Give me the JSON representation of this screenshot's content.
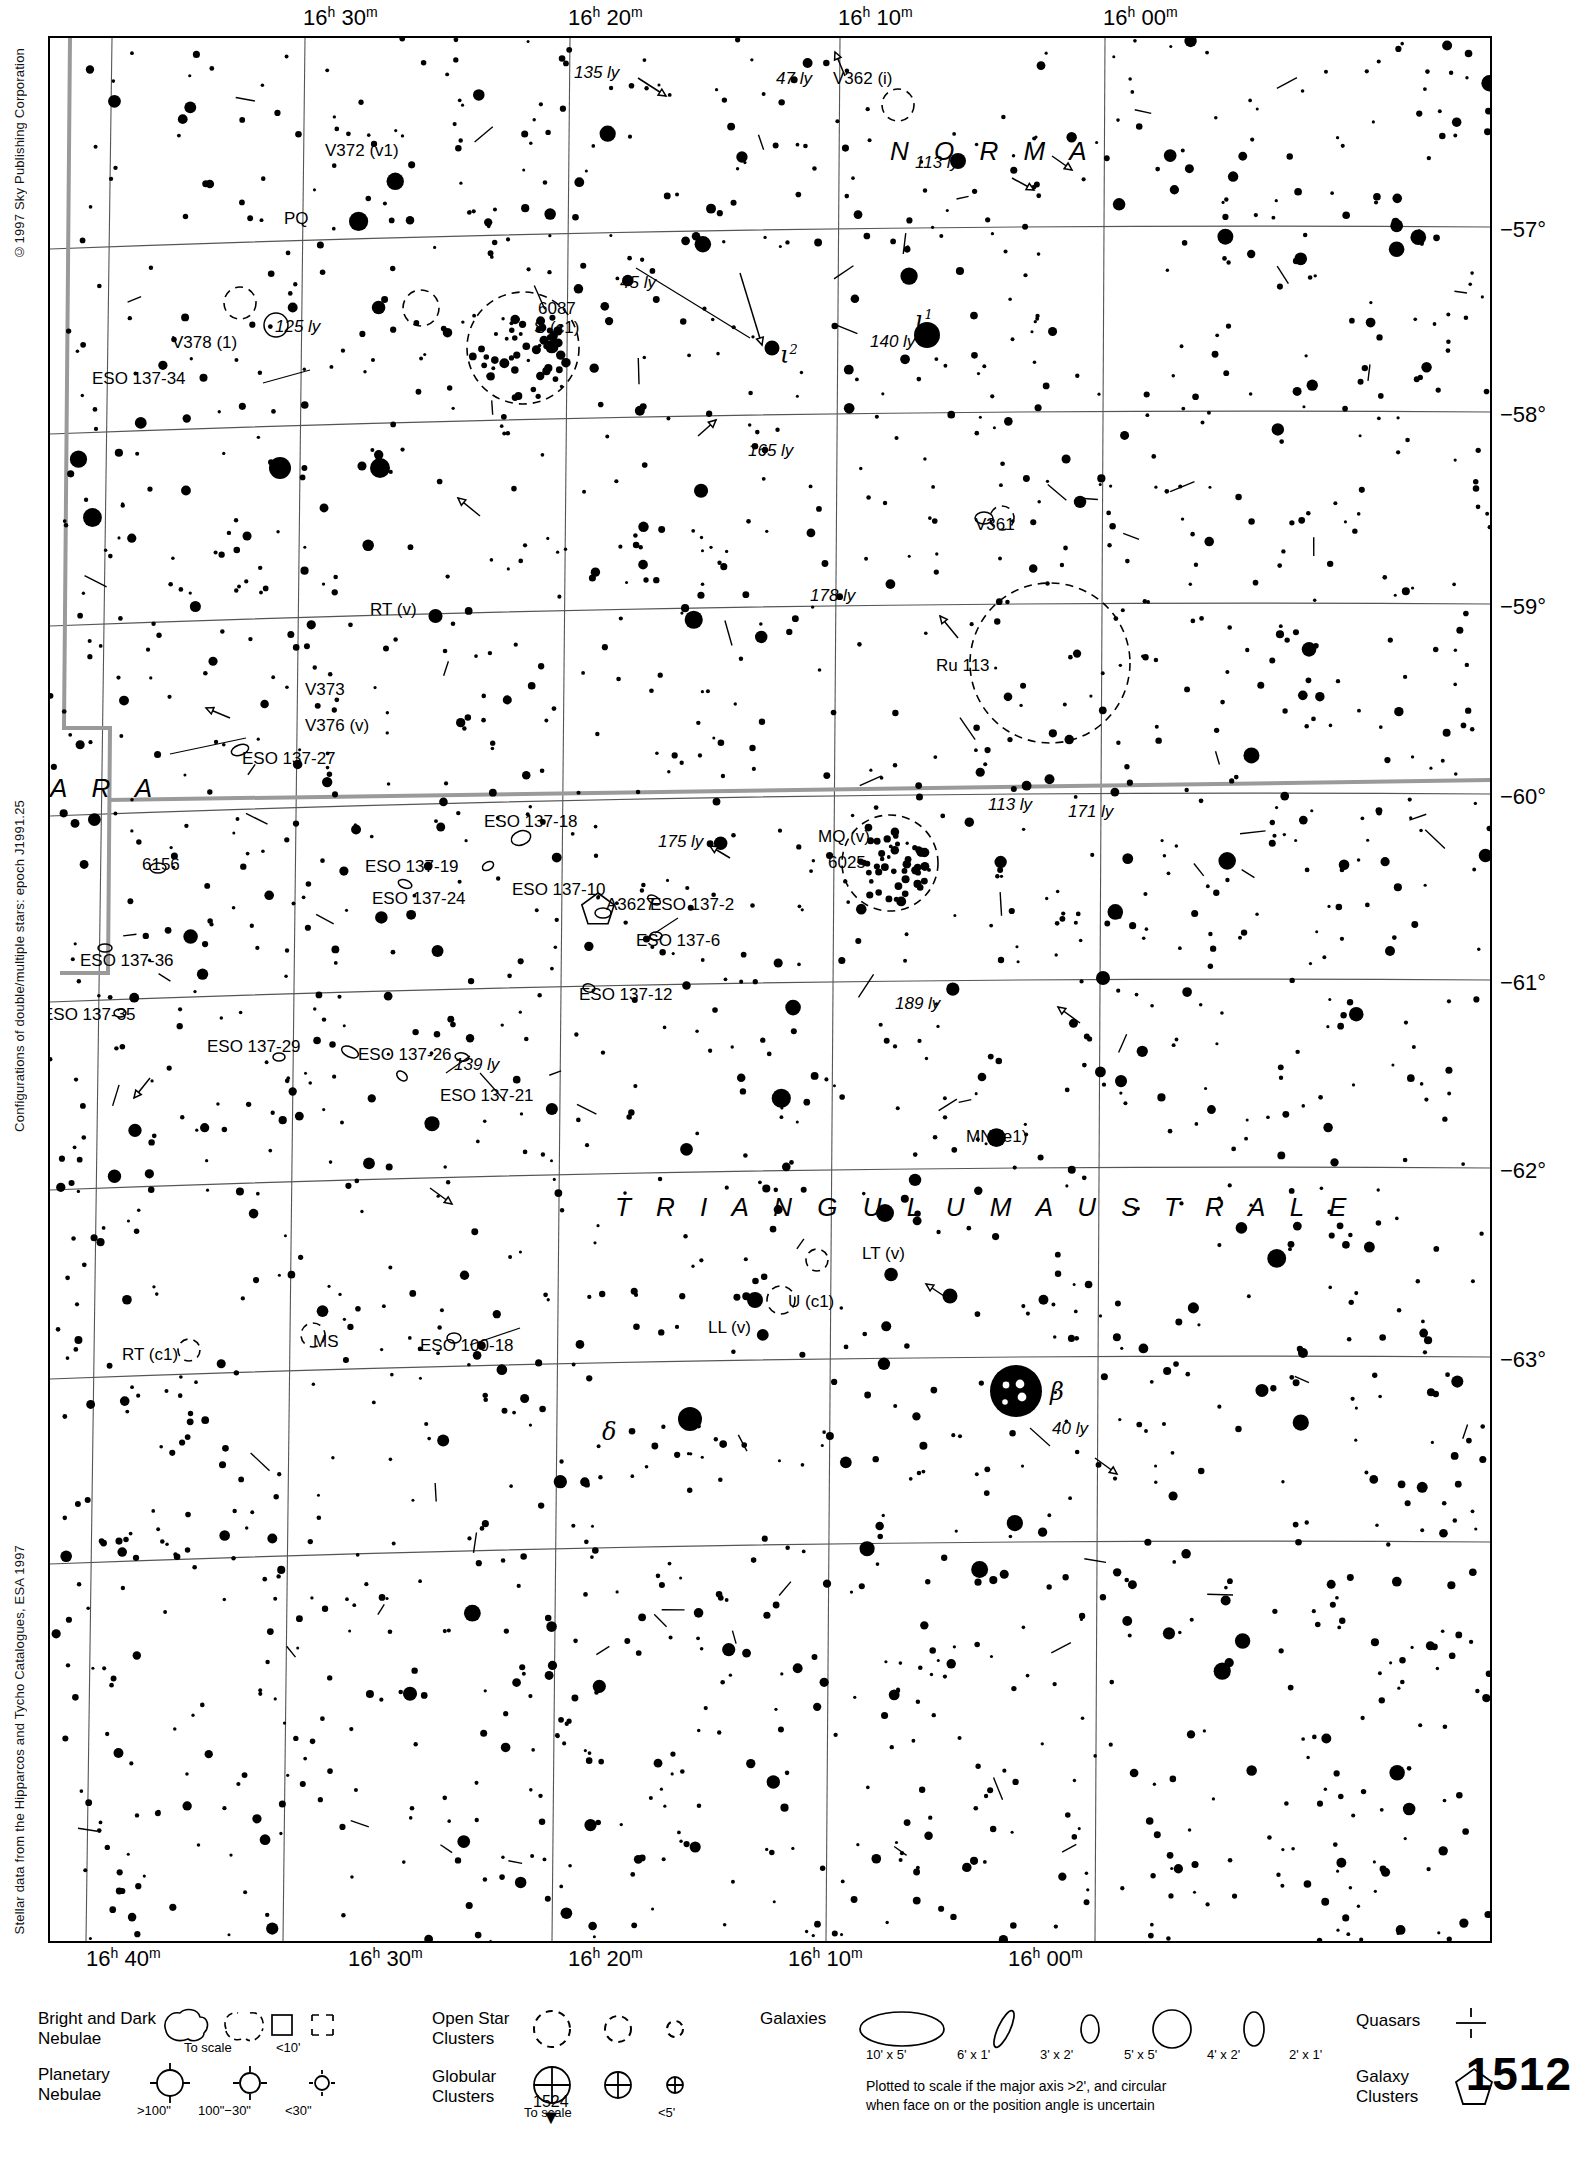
{
  "meta": {
    "chart_number": "1512",
    "copyright": "©1997 Sky Publishing Corporation",
    "config_note": "Configurations of double/multiple stars: epoch J1991.25",
    "data_note": "Stellar data from the Hipparcos and Tycho Catalogues, ESA 1997",
    "next_chart_label": "1524",
    "next_chart_arrow": "▼"
  },
  "axes": {
    "ra_top": [
      {
        "label": "16h 30m",
        "h": "16",
        "m": "30",
        "x": 255
      },
      {
        "label": "16h 20m",
        "h": "16",
        "m": "20",
        "x": 520
      },
      {
        "label": "16h 10m",
        "h": "16",
        "m": "10",
        "x": 790
      },
      {
        "label": "16h 00m",
        "h": "16",
        "m": "00",
        "x": 1055
      }
    ],
    "ra_bottom": [
      {
        "label": "16h 40m",
        "h": "16",
        "m": "40",
        "x": 38
      },
      {
        "label": "16h 30m",
        "h": "16",
        "m": "30",
        "x": 300
      },
      {
        "label": "16h 20m",
        "h": "16",
        "m": "20",
        "x": 520
      },
      {
        "label": "16h 10m",
        "h": "16",
        "m": "10",
        "x": 740
      },
      {
        "label": "16h 00m",
        "h": "16",
        "m": "00",
        "x": 960
      }
    ],
    "dec_right": [
      {
        "label": "−57°",
        "y": 195
      },
      {
        "label": "−58°",
        "y": 380
      },
      {
        "label": "−59°",
        "y": 572
      },
      {
        "label": "−60°",
        "y": 762
      },
      {
        "label": "−61°",
        "y": 948
      },
      {
        "label": "−62°",
        "y": 1136
      },
      {
        "label": "−63°",
        "y": 1325
      }
    ]
  },
  "constellations": [
    {
      "name": "N O R M A",
      "x": 840,
      "y": 98
    },
    {
      "name": "A R A",
      "x": 0,
      "y": 735
    },
    {
      "name": "T R I A N G U L U M   A U S T R A L E",
      "x": 565,
      "y": 1154
    }
  ],
  "labels": [
    {
      "text": "135 ly",
      "x": 524,
      "y": 26,
      "italic": true
    },
    {
      "text": "47 ly",
      "x": 726,
      "y": 32,
      "italic": true
    },
    {
      "text": "V362 (i)",
      "x": 783,
      "y": 32,
      "italic": false
    },
    {
      "text": "V372 (v1)",
      "x": 275,
      "y": 104,
      "italic": false
    },
    {
      "text": "113 ly",
      "x": 865,
      "y": 116,
      "italic": true
    },
    {
      "text": "PQ",
      "x": 234,
      "y": 172,
      "italic": false
    },
    {
      "text": "45 ly",
      "x": 570,
      "y": 236,
      "italic": true
    },
    {
      "text": "6087",
      "x": 488,
      "y": 262,
      "italic": false
    },
    {
      "text": "S (c1)",
      "x": 484,
      "y": 281,
      "italic": false
    },
    {
      "text": "125 ly",
      "x": 225,
      "y": 280,
      "italic": true
    },
    {
      "text": "V378 (1)",
      "x": 122,
      "y": 296,
      "italic": false
    },
    {
      "text": "140 ly",
      "x": 820,
      "y": 295,
      "italic": true
    },
    {
      "text": "ESO 137-34",
      "x": 42,
      "y": 332,
      "italic": false
    },
    {
      "text": "165 ly",
      "x": 698,
      "y": 404,
      "italic": true
    },
    {
      "text": "V361",
      "x": 925,
      "y": 478,
      "italic": false
    },
    {
      "text": "178 ly",
      "x": 760,
      "y": 549,
      "italic": true
    },
    {
      "text": "RT (v)",
      "x": 320,
      "y": 563,
      "italic": false
    },
    {
      "text": "Ru 113",
      "x": 886,
      "y": 619,
      "italic": false
    },
    {
      "text": "V373",
      "x": 255,
      "y": 643,
      "italic": false
    },
    {
      "text": "V376 (v)",
      "x": 255,
      "y": 679,
      "italic": false
    },
    {
      "text": "ESO 137-27",
      "x": 192,
      "y": 712,
      "italic": false
    },
    {
      "text": "ESO 137-18",
      "x": 434,
      "y": 775,
      "italic": false
    },
    {
      "text": "113 ly",
      "x": 938,
      "y": 758,
      "italic": true
    },
    {
      "text": "171 ly",
      "x": 1018,
      "y": 765,
      "italic": true
    },
    {
      "text": "175 ly",
      "x": 608,
      "y": 795,
      "italic": true
    },
    {
      "text": "MQ (v)",
      "x": 768,
      "y": 790,
      "italic": false
    },
    {
      "text": "6025",
      "x": 778,
      "y": 816,
      "italic": false
    },
    {
      "text": "6156",
      "x": 92,
      "y": 818,
      "italic": false
    },
    {
      "text": "ESO 137-19",
      "x": 315,
      "y": 820,
      "italic": false
    },
    {
      "text": "ESO 137-10",
      "x": 462,
      "y": 843,
      "italic": false
    },
    {
      "text": "ESO 137-24",
      "x": 322,
      "y": 852,
      "italic": false
    },
    {
      "text": "A3627",
      "x": 556,
      "y": 858,
      "italic": false
    },
    {
      "text": "ESO 137-2",
      "x": 600,
      "y": 858,
      "italic": false
    },
    {
      "text": "ESO 137-6",
      "x": 586,
      "y": 894,
      "italic": false
    },
    {
      "text": "ESO 137-36",
      "x": 30,
      "y": 914,
      "italic": false
    },
    {
      "text": "ESO 137-12",
      "x": 529,
      "y": 948,
      "italic": false
    },
    {
      "text": "189 ly",
      "x": 845,
      "y": 957,
      "italic": true
    },
    {
      "text": "ESO 137-35",
      "x": -8,
      "y": 968,
      "italic": false
    },
    {
      "text": "ESO 137-29",
      "x": 157,
      "y": 1000,
      "italic": false
    },
    {
      "text": "ESO 137-26",
      "x": 308,
      "y": 1008,
      "italic": false
    },
    {
      "text": "139 ly",
      "x": 404,
      "y": 1018,
      "italic": true
    },
    {
      "text": "ESO 137-21",
      "x": 390,
      "y": 1049,
      "italic": false
    },
    {
      "text": "MN (e1)",
      "x": 916,
      "y": 1090,
      "italic": false
    },
    {
      "text": "LT (v)",
      "x": 812,
      "y": 1207,
      "italic": false
    },
    {
      "text": "U (c1)",
      "x": 738,
      "y": 1255,
      "italic": false
    },
    {
      "text": "LL (v)",
      "x": 658,
      "y": 1281,
      "italic": false
    },
    {
      "text": "RT (c1)",
      "x": 72,
      "y": 1308,
      "italic": false
    },
    {
      "text": "MS",
      "x": 263,
      "y": 1295,
      "italic": false
    },
    {
      "text": "ESO 100-18",
      "x": 370,
      "y": 1299,
      "italic": false
    },
    {
      "text": "40 ly",
      "x": 1002,
      "y": 1382,
      "italic": true
    }
  ],
  "greek_labels": [
    {
      "glyph": "ι",
      "sup": "1",
      "x": 865,
      "y": 268
    },
    {
      "glyph": "ι",
      "sup": "2",
      "x": 730,
      "y": 303
    },
    {
      "glyph": "δ",
      "sup": "",
      "x": 552,
      "y": 1380
    },
    {
      "glyph": "β",
      "sup": "",
      "x": 1000,
      "y": 1340
    }
  ],
  "legend": {
    "bright_dark_nebulae": {
      "title": "Bright and Dark\nNebulae",
      "captions": [
        "To scale",
        "<10'"
      ]
    },
    "planetary_nebulae": {
      "title": "Planetary\nNebulae",
      "captions": [
        ">100\"",
        "100\"−30\"",
        "<30\""
      ]
    },
    "open_star_clusters": {
      "title": "Open Star\nClusters",
      "captions": []
    },
    "globular_clusters": {
      "title": "Globular\nClusters",
      "captions": [
        "To scale",
        "<5'"
      ]
    },
    "galaxies": {
      "title": "Galaxies",
      "captions": [
        "10' x 5'",
        "6' x 1'",
        "3' x 2'",
        "5' x 5'",
        "4' x 2'",
        "2' x 1'"
      ],
      "note": "Plotted to scale if the major axis >2', and circular\nwhen face on or the position angle is uncertain"
    },
    "quasars": {
      "title": "Quasars"
    },
    "galaxy_clusters": {
      "title": "Galaxy\nClusters"
    }
  },
  "chart_data": {
    "type": "scatter",
    "xlabel": "Right Ascension",
    "ylabel": "Declination",
    "xlim_ra": [
      "16h 40m",
      "15h 58m"
    ],
    "ylim_dec": [
      -56.6,
      -63.4
    ],
    "grid": true,
    "epoch": "J2000",
    "ra_ticks": [
      "16h 40m",
      "16h 30m",
      "16h 20m",
      "16h 10m",
      "16h 00m"
    ],
    "dec_ticks": [
      "−57°",
      "−58°",
      "−59°",
      "−60°",
      "−61°",
      "−62°",
      "−63°"
    ],
    "series": [
      {
        "name": "stars",
        "marker": "filled-circle",
        "size_encodes": "apparent magnitude",
        "count_approx": 1900
      },
      {
        "name": "deep-sky objects",
        "items": [
          {
            "id": "NGC 6087",
            "type": "open-cluster",
            "ra": "16h 18.9m",
            "dec": "-57.9"
          },
          {
            "id": "NGC 6025",
            "type": "open-cluster",
            "ra": "16h 03.7m",
            "dec": "-60.4"
          },
          {
            "id": "NGC 6156",
            "type": "galaxy",
            "ra": "16h 34.8m",
            "dec": "-60.6"
          },
          {
            "id": "Ru 113",
            "type": "open-cluster",
            "ra": "16h 03m",
            "dec": "-59.2"
          },
          {
            "id": "A3627",
            "type": "galaxy-cluster",
            "ra": "16h 15m",
            "dec": "-60.9"
          }
        ]
      }
    ]
  }
}
